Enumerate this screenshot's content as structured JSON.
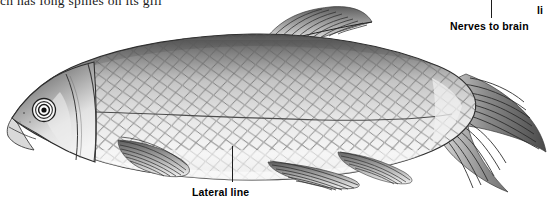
{
  "page": {
    "width": 551,
    "height": 201,
    "background": "#ffffff",
    "kind": "figure"
  },
  "body_text": {
    "clipped_line": "ch has long spines on its gill"
  },
  "figure": {
    "organism": "bony fish (lateral view, left-facing)",
    "style": "graphite / ink scientific illustration, grayscale",
    "ink": "#2a2a2a",
    "body_fill_light": "#f2f2f2",
    "body_fill_mid": "#b9b9b9",
    "body_fill_dark": "#5a5a5a",
    "parts": [
      "snout",
      "eye",
      "operculum",
      "dorsal-fin",
      "pectoral-fin",
      "pelvic-fin",
      "anal-fin",
      "caudal-fin",
      "scales",
      "lateral-line"
    ]
  },
  "callouts": [
    {
      "id": "nerves",
      "label": "Nerves to brain",
      "leader": "vertical",
      "leader_x": 491,
      "leader_from_y": 0,
      "leader_to_y": 18,
      "label_x": 450,
      "label_y": 20
    },
    {
      "id": "lateral",
      "label": "Lateral line",
      "leader": "vertical",
      "leader_x": 232,
      "leader_from_y": 146,
      "leader_to_y": 182,
      "label_x": 192,
      "label_y": 186
    },
    {
      "id": "clipped-right",
      "label": "li",
      "leader": "none",
      "label_x": 537,
      "label_y": 4
    }
  ]
}
